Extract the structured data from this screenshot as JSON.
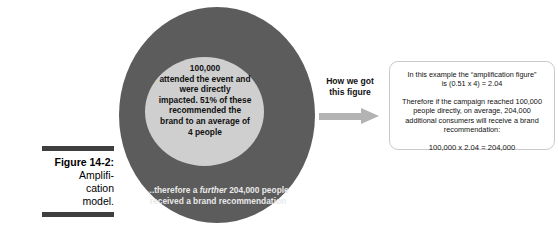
{
  "figure": {
    "caption_line1": "Figure 14-2:",
    "caption_line2": "Amplifi-",
    "caption_line3": "cation",
    "caption_line4": "model."
  },
  "diagram": {
    "inner_circle": {
      "line1": "100,000",
      "line2": "attended the event and",
      "line3": "were directly",
      "line4": "impacted. 51% of these",
      "line5": "recommended the",
      "line6": "brand to an average of",
      "line7": "4 people"
    },
    "outer_circle": {
      "line1_pre": "...therefore a ",
      "line1_em": "further",
      "line1_post": " 204,000 people",
      "line2": "received a brand recommendation"
    },
    "colors": {
      "outer_ring": "#5c5c5c",
      "inner_disc": "#cfcfcf",
      "arrow": "#b3b3b3",
      "rule": "#3f3f3f",
      "box_border": "#c9c9c9"
    }
  },
  "connector": {
    "label_line1": "How we got",
    "label_line2": "this figure",
    "arrow_icon": "arrow-right-icon"
  },
  "explanation": {
    "para1_line1": "In this example the “amplification figure”",
    "para1_line2": "is (0.51 x 4) = 2.04",
    "para2_line1": "Therefore if the campaign reached 100,000",
    "para2_line2": "people directly, on average, 204,000",
    "para2_line3": "additional consumers will receive a brand",
    "para2_line4": "recommendation:",
    "equation": "100,000 x 2.04 = 204,000"
  }
}
